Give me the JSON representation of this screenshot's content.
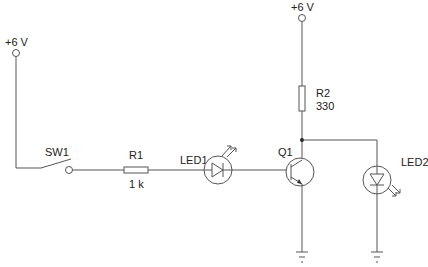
{
  "diagram": {
    "type": "circuit-schematic",
    "colors": {
      "wire": "#555555",
      "text": "#222222",
      "background": "#ffffff"
    },
    "supplies": [
      {
        "id": "vcc-left",
        "label": "+6 V"
      },
      {
        "id": "vcc-right",
        "label": "+6 V"
      }
    ],
    "components": {
      "sw1": {
        "label": "SW1",
        "type": "switch"
      },
      "r1": {
        "label": "R1",
        "value": "1 k",
        "type": "resistor"
      },
      "led1": {
        "label": "LED1",
        "type": "photodiode-led-receiving"
      },
      "q1": {
        "label": "Q1",
        "type": "npn-transistor"
      },
      "r2": {
        "label": "R2",
        "value": "330",
        "type": "resistor"
      },
      "led2": {
        "label": "LED2",
        "type": "led-emitting"
      }
    },
    "grounds": [
      {
        "id": "gnd-q1"
      },
      {
        "id": "gnd-led2"
      }
    ]
  }
}
